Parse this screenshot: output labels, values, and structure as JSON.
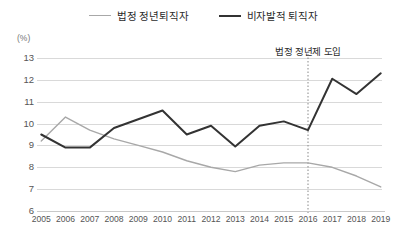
{
  "legend": {
    "items": [
      {
        "label": "법정 정년퇴직자",
        "color": "#a8a8a8",
        "key": "statutory"
      },
      {
        "label": "비자발적 퇴직자",
        "color": "#333333",
        "key": "involuntary"
      }
    ]
  },
  "unit_label": "(%)",
  "annotation": {
    "text": "법정 정년제 도입",
    "at_category": "2016",
    "line_style": "dotted",
    "line_color": "#888888"
  },
  "axis": {
    "y_ticks": [
      "13",
      "12",
      "11",
      "10",
      "9",
      "8",
      "7",
      "6"
    ],
    "x_ticks": [
      "2005",
      "2006",
      "2007",
      "2008",
      "2009",
      "2010",
      "2011",
      "2012",
      "2013",
      "2014",
      "2015",
      "2016",
      "2017",
      "2018",
      "2019"
    ]
  },
  "chart_data": {
    "type": "line",
    "title": "",
    "subtitle": "",
    "xlabel": "",
    "ylabel": "(%)",
    "ylim": [
      6,
      13
    ],
    "grid": true,
    "legend_position": "top-center",
    "categories": [
      "2005",
      "2006",
      "2007",
      "2008",
      "2009",
      "2010",
      "2011",
      "2012",
      "2013",
      "2014",
      "2015",
      "2016",
      "2017",
      "2018",
      "2019"
    ],
    "series": [
      {
        "name": "법정 정년퇴직자",
        "color": "#a8a8a8",
        "width": 1.4,
        "values": [
          9.2,
          10.3,
          9.7,
          9.3,
          9.0,
          8.7,
          8.3,
          8.0,
          7.8,
          8.1,
          8.2,
          8.2,
          8.0,
          7.6,
          7.1
        ]
      },
      {
        "name": "비자발적 퇴직자",
        "color": "#333333",
        "width": 2.0,
        "values": [
          9.5,
          8.9,
          8.9,
          9.8,
          10.2,
          10.6,
          9.5,
          9.9,
          8.95,
          9.9,
          10.1,
          9.7,
          12.05,
          11.35,
          12.3
        ]
      }
    ],
    "annotations": [
      {
        "text": "법정 정년제 도입",
        "x": "2016",
        "type": "vertical-dotted-line"
      }
    ]
  }
}
